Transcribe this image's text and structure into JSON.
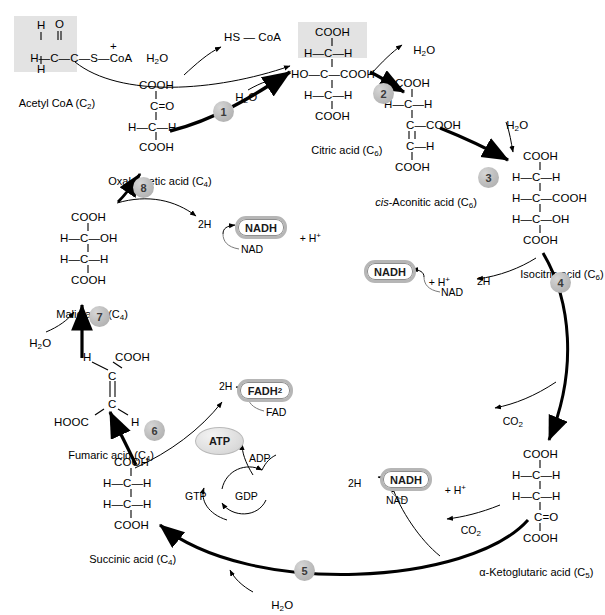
{
  "figure": {
    "type": "diagram"
  },
  "colors": {
    "highlight_box": "#e3e3e3",
    "step_circle": "#bdbdbd",
    "pill_border": "#b6b6b6",
    "stroke": "#000000"
  },
  "metabolites": {
    "acetyl_coa": {
      "label": "Acetyl CoA (C",
      "label_sub": "2",
      "label_close": ")",
      "l1": "H",
      "l2": "O",
      "l3_a": "H",
      "l3_b": "C",
      "l3_c": "C",
      "l3_d": "S",
      "l3_e": "CoA",
      "l4": "H",
      "plus": "+",
      "water": "H",
      "water_sub": "2",
      "water_close": "O"
    },
    "oxaloacetic": {
      "name": "Oxaloacetic acid (C",
      "name_sub": "4",
      "name_close": ")",
      "r1": "COOH",
      "r2": "C=O",
      "r3": "H—C—H",
      "r4": "COOH"
    },
    "citric": {
      "name": "Citric acid (C",
      "name_sub": "6",
      "name_close": ")",
      "r1": "COOH",
      "r2": "H—C—H",
      "r3": "HO—C—COOH",
      "r4": "H—C—H",
      "r5": "COOH"
    },
    "cis_aconitic": {
      "name_ital": "cis",
      "name": "-Aconitic acid (C",
      "name_sub": "6",
      "name_close": ")",
      "r1": "COOH",
      "r2": "H—C—H",
      "r3": "C—COOH",
      "r4": "C—H",
      "r5": "COOH"
    },
    "isocitric": {
      "name": "Isocitric acid (C",
      "name_sub": "6",
      "name_close": ")",
      "r1": "COOH",
      "r2": "H—C—H",
      "r3": "H—C—COOH",
      "r4": "H—C—OH",
      "r5": "COOH"
    },
    "alpha_ketoglutaric": {
      "name": "α-Ketoglutaric acid (C",
      "name_sub": "5",
      "name_close": ")",
      "r1": "COOH",
      "r2": "H—C—H",
      "r3": "H—C—H",
      "r4": "C=O",
      "r5": "COOH"
    },
    "succinic": {
      "name": "Succinic acid (C",
      "name_sub": "4",
      "name_close": ")",
      "r1": "COOH",
      "r2": "H—C—H",
      "r3": "H—C—H",
      "r4": "COOH"
    },
    "fumaric": {
      "name": "Fumaric acid (C",
      "name_sub": "4",
      "name_close": ")",
      "r1_h": "H",
      "r1_cooh": "COOH",
      "r2": "C",
      "r3": "C",
      "r4_hooc": "HOOC",
      "r4_h": "H"
    },
    "malic": {
      "name": "Malic acid (C",
      "name_sub": "4",
      "name_close": ")",
      "r1": "COOH",
      "r2": "H—C—OH",
      "r3": "H—C—H",
      "r4": "COOH"
    }
  },
  "steps": [
    {
      "num": "1"
    },
    {
      "num": "2"
    },
    {
      "num": "3"
    },
    {
      "num": "4"
    },
    {
      "num": "5"
    },
    {
      "num": "6"
    },
    {
      "num": "7"
    },
    {
      "num": "8"
    }
  ],
  "cofactors": {
    "hs_coa": "HS — CoA",
    "nadh": "NADH",
    "nad": "NAD",
    "plus_h": "+ H",
    "plus_h_sup": "+",
    "two_h": "2H",
    "fadh2": "FADH",
    "fadh2_sub": "2",
    "fad": "FAD",
    "atp": "ATP",
    "adp": "ADP",
    "gtp": "GTP",
    "gdp": "GDP",
    "co2": "CO",
    "co2_sub": "2",
    "h2o": "H",
    "h2o_sub": "2",
    "h2o_close": "O"
  }
}
